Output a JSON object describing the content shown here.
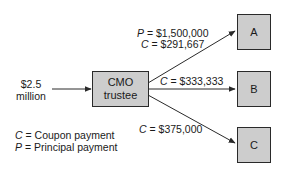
{
  "diagram": {
    "input": {
      "line1": "$2.5",
      "line2": "million"
    },
    "trustee": {
      "line1": "CMO",
      "line2": "trustee"
    },
    "tranches": [
      {
        "label": "A"
      },
      {
        "label": "B"
      },
      {
        "label": "C"
      }
    ],
    "flows": {
      "a": {
        "p_sym": "P",
        "p_value": " = $1,500,000",
        "c_sym": "C",
        "c_value": " = $291,667"
      },
      "b": {
        "c_sym": "C",
        "c_value": " = $333,333"
      },
      "c": {
        "c_sym": "C",
        "c_value": " = $375,000"
      }
    },
    "legend": [
      {
        "sym": "C",
        "text": " = Coupon payment"
      },
      {
        "sym": "P",
        "text": " = Principal payment"
      }
    ],
    "colors": {
      "box_fill": "#cdcdcd",
      "box_border": "#2a2a2a",
      "line": "#2a2a2a"
    }
  }
}
